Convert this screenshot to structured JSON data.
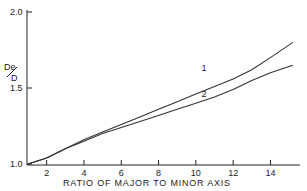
{
  "chart_data": {
    "type": "line",
    "title": "",
    "xlabel": "RATIO OF MAJOR TO MINOR AXIS",
    "ylabel": "De/D",
    "ylabel_parts": {
      "num": "De",
      "den": "D"
    },
    "xlim": [
      1,
      15.5
    ],
    "ylim": [
      1.0,
      2.0
    ],
    "x_ticks": [
      2,
      4,
      6,
      8,
      10,
      12,
      14
    ],
    "y_ticks": [
      {
        "value": 1.0,
        "label": "1.0"
      },
      {
        "value": 1.5,
        "label": "1.5"
      },
      {
        "value": 2.0,
        "label": "2.0"
      }
    ],
    "grid": false,
    "legend": "inline curve labels",
    "series": [
      {
        "name": "1",
        "x": [
          1,
          2,
          3,
          4,
          5,
          6,
          7,
          8,
          9,
          10,
          11,
          12,
          13,
          14,
          15.2
        ],
        "y": [
          1.0,
          1.04,
          1.1,
          1.16,
          1.21,
          1.26,
          1.31,
          1.36,
          1.41,
          1.46,
          1.51,
          1.56,
          1.62,
          1.7,
          1.8
        ]
      },
      {
        "name": "2",
        "x": [
          1,
          2,
          3,
          4,
          5,
          6,
          7,
          8,
          9,
          10,
          11,
          12,
          13,
          14,
          15.2
        ],
        "y": [
          1.0,
          1.04,
          1.1,
          1.15,
          1.2,
          1.24,
          1.28,
          1.32,
          1.36,
          1.4,
          1.44,
          1.49,
          1.55,
          1.6,
          1.65
        ]
      }
    ],
    "curve_labels": [
      {
        "text": "1",
        "x": 10.3,
        "y": 1.61
      },
      {
        "text": "2",
        "x": 10.3,
        "y": 1.44
      }
    ]
  }
}
